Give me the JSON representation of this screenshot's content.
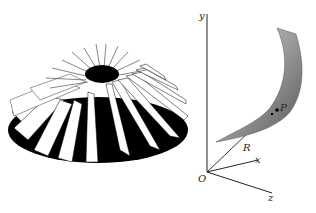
{
  "figure": {
    "left_panel": {
      "subject": "impeller-3d-render",
      "blade_count": 22
    },
    "right_panel": {
      "subject": "blade-surface-with-axes",
      "axis_labels": {
        "y": "y",
        "x": "x",
        "z": "z",
        "origin": "O"
      },
      "vector_label": "R",
      "point_label": "P"
    }
  }
}
